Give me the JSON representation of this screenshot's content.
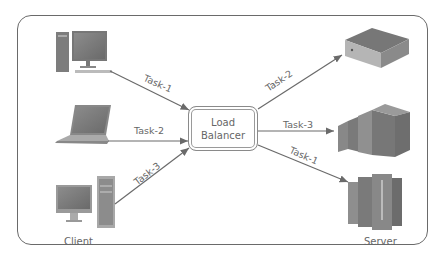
{
  "diagram": {
    "title": "Load Balancer",
    "load_balancer": {
      "line1": "Load",
      "line2": "Balancer"
    },
    "groups": {
      "client": "Client",
      "server": "Server"
    },
    "client_nodes": [
      {
        "icon": "desktop-pc-icon",
        "task": "Task-1"
      },
      {
        "icon": "laptop-icon",
        "task": "Task-2"
      },
      {
        "icon": "all-in-one-computer-icon",
        "task": "Task-3"
      }
    ],
    "server_nodes": [
      {
        "icon": "rack-server-icon",
        "task": "Task-2"
      },
      {
        "icon": "blade-server-icon",
        "task": "Task-3"
      },
      {
        "icon": "tower-server-icon",
        "task": "Task-1"
      }
    ],
    "colors": {
      "line": "#6a6a6a",
      "device": "#7a7a7a",
      "text": "#666666"
    }
  }
}
